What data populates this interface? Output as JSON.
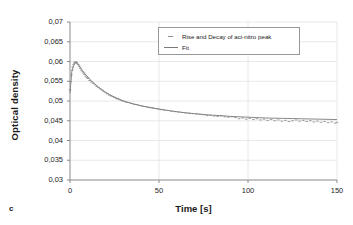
{
  "panel": {
    "label": "c"
  },
  "chart_data": {
    "type": "scatter",
    "title": "",
    "xlabel": "Time [s]",
    "ylabel": "Optical density",
    "xlim": [
      0,
      150
    ],
    "ylim": [
      0.03,
      0.07
    ],
    "grid": true,
    "legend_position": "top-center-right",
    "xticks": [
      "0",
      "50",
      "100",
      "150"
    ],
    "xtick_values": [
      0,
      50,
      100,
      150
    ],
    "yticks": [
      "0,03",
      "0,035",
      "0,04",
      "0,045",
      "0,05",
      "0,055",
      "0,06",
      "0,065",
      "0,07"
    ],
    "ytick_values": [
      0.03,
      0.035,
      0.04,
      0.045,
      0.05,
      0.055,
      0.06,
      0.065,
      0.07
    ],
    "series": [
      {
        "name": "Rise and Decay of aci-nitro peak",
        "type": "scatter",
        "marker": "dash",
        "color": "#8c8c8c",
        "x": [
          0.0,
          0.4,
          0.8,
          1.2,
          1.6,
          2.0,
          2.4,
          2.8,
          3.2,
          3.6,
          4.0,
          4.6,
          5.2,
          5.8,
          6.4,
          7.0,
          7.6,
          8.2,
          8.8,
          9.4,
          10.0,
          11.0,
          12.0,
          13.0,
          14.0,
          15.0,
          16.0,
          17.0,
          18.0,
          19.0,
          20.0,
          21.0,
          22.0,
          23.0,
          24.0,
          25.0,
          26.0,
          27.0,
          28.0,
          29.0,
          30.0,
          31.5,
          33.0,
          34.5,
          36.0,
          37.5,
          39.0,
          40.5,
          42.0,
          43.5,
          45.0,
          46.5,
          48.0,
          49.5,
          51.0,
          53.0,
          55.0,
          57.0,
          59.0,
          61.0,
          63.0,
          65.0,
          67.0,
          69.0,
          71.0,
          73.0,
          75.0,
          77.0,
          79.0,
          81.0,
          83.0,
          85.0,
          87.0,
          89.0,
          91.0,
          93.0,
          95.0,
          97.0,
          99.0,
          101.0,
          103.0,
          105.0,
          107.0,
          109.0,
          111.0,
          113.0,
          115.0,
          117.0,
          119.0,
          121.0,
          123.0,
          125.0,
          127.0,
          129.0,
          131.0,
          133.0,
          135.0,
          137.0,
          139.0,
          141.0,
          143.0,
          145.0,
          147.0,
          149.0,
          150.0
        ],
        "y": [
          0.0528,
          0.0549,
          0.0566,
          0.0578,
          0.0586,
          0.0592,
          0.0596,
          0.0598,
          0.0599,
          0.0598,
          0.0596,
          0.0592,
          0.0588,
          0.0583,
          0.0578,
          0.0574,
          0.0571,
          0.0567,
          0.0563,
          0.056,
          0.0557,
          0.0552,
          0.0548,
          0.0545,
          0.0541,
          0.0537,
          0.0534,
          0.0531,
          0.0528,
          0.0524,
          0.0521,
          0.0518,
          0.0515,
          0.0513,
          0.0511,
          0.0509,
          0.0506,
          0.0505,
          0.0503,
          0.0501,
          0.05,
          0.0497,
          0.0496,
          0.0494,
          0.0492,
          0.0491,
          0.0489,
          0.0487,
          0.0486,
          0.0485,
          0.0484,
          0.0483,
          0.0481,
          0.048,
          0.0478,
          0.0477,
          0.0476,
          0.0474,
          0.0473,
          0.0472,
          0.0471,
          0.047,
          0.0469,
          0.0468,
          0.0467,
          0.0466,
          0.0465,
          0.0463,
          0.0464,
          0.0462,
          0.0461,
          0.0462,
          0.046,
          0.0459,
          0.046,
          0.0458,
          0.0455,
          0.0457,
          0.0454,
          0.0456,
          0.0453,
          0.0455,
          0.0452,
          0.0454,
          0.0451,
          0.0453,
          0.045,
          0.0452,
          0.0449,
          0.0451,
          0.0448,
          0.045,
          0.0452,
          0.0449,
          0.0451,
          0.0448,
          0.045,
          0.0447,
          0.0449,
          0.0446,
          0.0448,
          0.0445,
          0.0447,
          0.0444,
          0.0446
        ]
      },
      {
        "name": "Fit",
        "type": "line",
        "color": "#7a7a7a",
        "x": [
          0.0,
          1.0,
          2.0,
          3.0,
          4.0,
          5.0,
          6.0,
          7.0,
          8.0,
          9.0,
          10.0,
          12.0,
          14.0,
          16.0,
          18.0,
          20.0,
          22.0,
          24.0,
          26.0,
          28.0,
          30.0,
          33.0,
          36.0,
          39.0,
          42.0,
          45.0,
          48.0,
          51.0,
          55.0,
          60.0,
          65.0,
          70.0,
          75.0,
          80.0,
          85.0,
          90.0,
          95.0,
          100.0,
          110.0,
          120.0,
          130.0,
          140.0,
          150.0
        ],
        "y": [
          0.052,
          0.0574,
          0.059,
          0.0597,
          0.0596,
          0.059,
          0.0583,
          0.0577,
          0.0571,
          0.0566,
          0.0561,
          0.0551,
          0.0543,
          0.0535,
          0.0528,
          0.0522,
          0.0517,
          0.0512,
          0.0508,
          0.0504,
          0.05,
          0.0496,
          0.0492,
          0.0489,
          0.0486,
          0.0483,
          0.0481,
          0.0479,
          0.0476,
          0.0473,
          0.047,
          0.0468,
          0.0466,
          0.0464,
          0.0463,
          0.0461,
          0.046,
          0.0459,
          0.0457,
          0.0456,
          0.0455,
          0.0454,
          0.0453
        ]
      }
    ]
  },
  "legend": {
    "items": [
      {
        "label": "Rise and Decay of aci-nitro peak",
        "key": "marker"
      },
      {
        "label": "Fit",
        "key": "line"
      }
    ]
  }
}
